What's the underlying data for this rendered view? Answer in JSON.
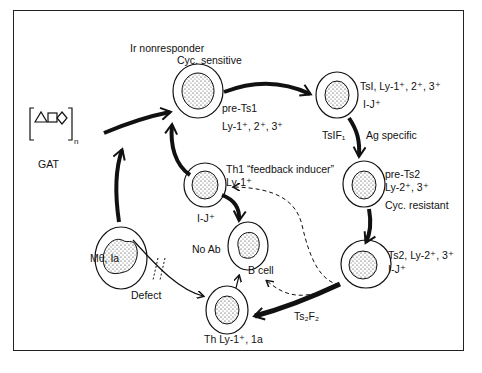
{
  "title": "Ir nonresponder",
  "antigen": {
    "label": "GAT",
    "subscript": "n"
  },
  "cells": {
    "cyc_sensitive": {
      "header": "Cyc. sensitive",
      "name": "pre-Ts1",
      "markers": "Ly-1⁺, 2⁺, 3⁺"
    },
    "tsi": {
      "line1": "TsI, Ly-1⁺, 2⁺, 3⁺",
      "line2": "I-J⁺"
    },
    "pre_ts2": {
      "name": "pre-Ts2",
      "markers": "Ly-2⁺, 3⁺",
      "footer": "Cyc. resistant"
    },
    "ts2": {
      "line1": "Ts2, Ly-2⁺, 3⁺",
      "line2": "I-J⁺"
    },
    "th1": {
      "line1": "Th1 “feedback inducer”",
      "line2": "Ly-1⁺",
      "footer": "I-J⁺"
    },
    "b_cell": {
      "left": "No Ab",
      "below": "B cell"
    },
    "macrophage": {
      "label": "Mθ, Ia"
    },
    "th": {
      "label": "Th Ly-1⁺, 1a"
    }
  },
  "arrows": {
    "tsif1": {
      "label": "TsIF₁",
      "note": "Ag specific"
    },
    "ts2f2": {
      "label": "Ts₂F₂"
    },
    "defect": {
      "label": "Defect"
    }
  },
  "colors": {
    "ink": "#111111",
    "background": "#ffffff"
  }
}
